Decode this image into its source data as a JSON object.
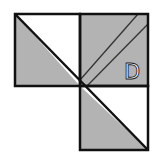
{
  "figure": {
    "label": "D",
    "colors": {
      "shade": "#b3b3b3",
      "background": "#ffffff",
      "stroke": "#111111",
      "thin_stroke": "#333333"
    },
    "squares": [
      {
        "name": "top-left",
        "x": 15,
        "y": 14,
        "size": 65
      },
      {
        "name": "top-right",
        "x": 80,
        "y": 14,
        "size": 68
      },
      {
        "name": "bottom-right",
        "x": 80,
        "y": 86,
        "size": 68
      }
    ]
  }
}
